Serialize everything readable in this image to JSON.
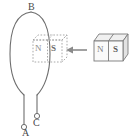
{
  "figure": {
    "type": "physics-diagram",
    "background_color": "#ffffff",
    "line_color": "#6e6e6e",
    "ghost_color": "#a9a9a9",
    "text_color": "#4a4a4a",
    "width": 132,
    "height": 140
  },
  "labels": {
    "coil_top": "B",
    "terminal_left": "A",
    "terminal_right": "C"
  },
  "ghost_magnet": {
    "name": "dashed-ghost-bar-magnet",
    "style": "dashed",
    "pole_left": "N",
    "pole_right": "S"
  },
  "solid_magnet": {
    "name": "solid-bar-magnet",
    "style": "solid-3d-box",
    "pole_left": "N",
    "pole_right": "S"
  },
  "motion_arrow": {
    "name": "motion-arrow",
    "direction": "left",
    "meaning": "magnet moves into the coil"
  },
  "coil": {
    "name": "wire-loop",
    "shape": "vertical-ellipse-loop",
    "lead_count": 2
  }
}
